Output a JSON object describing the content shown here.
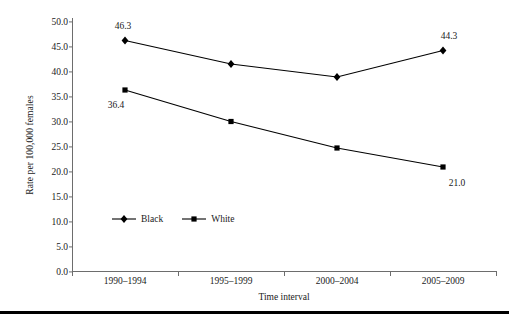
{
  "chart_data": {
    "type": "line",
    "title": "",
    "xlabel": "Time interval",
    "ylabel": "Rate per 100,000 females",
    "categories": [
      "1990–1994",
      "1995–1999",
      "2000–2004",
      "2005–2009"
    ],
    "series": [
      {
        "name": "Black",
        "marker": "diamond",
        "color": "#000000",
        "values": [
          46.3,
          41.6,
          39.0,
          44.3
        ],
        "point_labels": [
          "46.3",
          "",
          "",
          "44.3"
        ]
      },
      {
        "name": "White",
        "marker": "square",
        "color": "#000000",
        "values": [
          36.4,
          30.1,
          24.8,
          21.0
        ],
        "point_labels": [
          "36.4",
          "",
          "",
          "21.0"
        ]
      }
    ],
    "ylim": [
      0.0,
      50.0
    ],
    "ytick_labels": [
      "50.0",
      "45.0",
      "40.0",
      "35.0",
      "30.0",
      "25.0",
      "20.0",
      "15.0",
      "10.0",
      "5.0",
      "0.0"
    ],
    "ytick_values": [
      50.0,
      45.0,
      40.0,
      35.0,
      30.0,
      25.0,
      20.0,
      15.0,
      10.0,
      5.0,
      0.0
    ],
    "grid": false,
    "legend_position": "inside lower-left",
    "annotations": [
      {
        "text": "46.3",
        "series": "Black",
        "category": "1990–1994",
        "placement": "above-left"
      },
      {
        "text": "44.3",
        "series": "Black",
        "category": "2005–2009",
        "placement": "above"
      },
      {
        "text": "36.4",
        "series": "White",
        "category": "1990–1994",
        "placement": "below-left"
      },
      {
        "text": "21.0",
        "series": "White",
        "category": "2005–2009",
        "placement": "below-right"
      }
    ]
  },
  "legend": {
    "items": [
      {
        "label": "Black",
        "marker": "diamond"
      },
      {
        "label": "White",
        "marker": "square"
      }
    ]
  }
}
